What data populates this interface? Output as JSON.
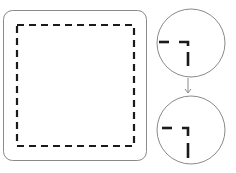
{
  "diagram": {
    "colors": {
      "outline": "#8a8a8a",
      "dash": "#1a1a1a",
      "background": "#ffffff"
    },
    "panel": {
      "label": "canvas-panel"
    },
    "magnifiers": [
      {
        "name": "corner-before"
      },
      {
        "name": "corner-after"
      }
    ],
    "arrow": {
      "direction": "down"
    }
  }
}
